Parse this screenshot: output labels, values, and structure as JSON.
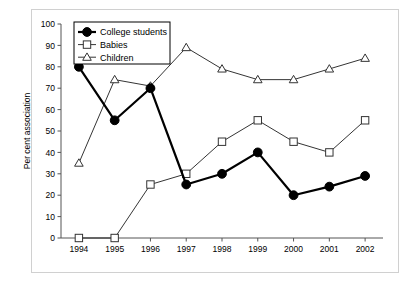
{
  "chart_data": {
    "type": "line",
    "title": "",
    "xlabel": "",
    "ylabel": "Per cent association",
    "categories": [
      "1994",
      "1995",
      "1996",
      "1997",
      "1998",
      "1999",
      "2000",
      "2001",
      "2002"
    ],
    "ylim": [
      0,
      100
    ],
    "yticks": [
      "0",
      "10",
      "20",
      "30",
      "40",
      "50",
      "60",
      "70",
      "80",
      "90",
      "100"
    ],
    "grid": false,
    "legend_position": "top-left",
    "series": [
      {
        "name": "College students",
        "marker": "filled-circle",
        "color": "#000000",
        "line_width": 2.2,
        "values": [
          80,
          55,
          70,
          25,
          30,
          40,
          20,
          24,
          29
        ]
      },
      {
        "name": "Babies",
        "marker": "open-square",
        "color": "#000000",
        "line_width": 0.8,
        "values": [
          0,
          0,
          25,
          30,
          45,
          55,
          45,
          40,
          55
        ]
      },
      {
        "name": "Children",
        "marker": "open-triangle",
        "color": "#000000",
        "line_width": 0.8,
        "values": [
          35,
          74,
          71,
          89,
          79,
          74,
          74,
          79,
          84
        ]
      }
    ]
  },
  "legend": {
    "items": [
      {
        "label": "College students"
      },
      {
        "label": "Babies"
      },
      {
        "label": "Children"
      }
    ]
  }
}
